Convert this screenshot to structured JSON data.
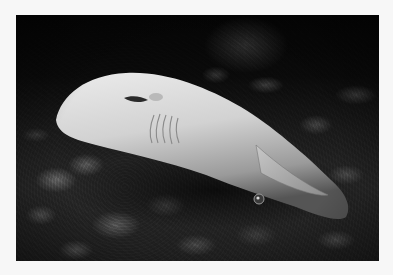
{
  "photo": {
    "subject": "shark resting on coral rubble with attached remora",
    "tone": "grayscale",
    "palette": {
      "border": "#f7f7f7",
      "background_water": "#0a0a0a",
      "rubble": "#4f4f4f",
      "shark_body": "#dcdcdc",
      "shark_shadow": "#8a8a8a"
    }
  }
}
